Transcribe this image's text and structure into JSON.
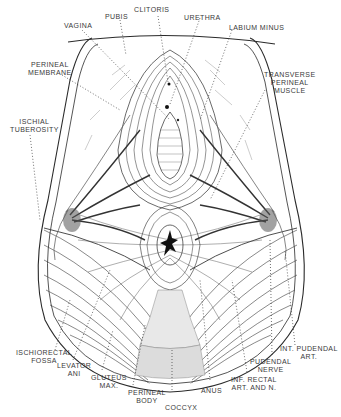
{
  "figure": {
    "colors": {
      "ink": "#2a2a2a",
      "label": "#3a3a3a",
      "background": "#ffffff",
      "shading": "#8a8a8a"
    },
    "labels": [
      {
        "id": "vagina",
        "line1": "VAGINA",
        "line2": ""
      },
      {
        "id": "pubis",
        "line1": "PUBIS",
        "line2": ""
      },
      {
        "id": "clitoris",
        "line1": "CLITORIS",
        "line2": ""
      },
      {
        "id": "urethra",
        "line1": "URETHRA",
        "line2": ""
      },
      {
        "id": "labium-minus",
        "line1": "LABIUM MINUS",
        "line2": ""
      },
      {
        "id": "perineal-membrane",
        "line1": "PERINEAL",
        "line2": "MEMBRANE"
      },
      {
        "id": "transverse-perineal-muscle",
        "line1": "TRANSVERSE",
        "line2": "PERINEAL",
        "line3": "MUSCLE"
      },
      {
        "id": "ischial-tuberosity",
        "line1": "ISCHIAL",
        "line2": "TUBEROSITY"
      },
      {
        "id": "ischiorectal-fossa",
        "line1": "ISCHIORECTAL",
        "line2": "FOSSA"
      },
      {
        "id": "levator-ani",
        "line1": "LEVATOR",
        "line2": "ANI"
      },
      {
        "id": "gluteus-max",
        "line1": "GLUTEUS",
        "line2": "MAX."
      },
      {
        "id": "perineal-body",
        "line1": "PERINEAL",
        "line2": "BODY"
      },
      {
        "id": "coccyx",
        "line1": "COCCYX",
        "line2": ""
      },
      {
        "id": "anus",
        "line1": "ANUS",
        "line2": ""
      },
      {
        "id": "inf-rectal",
        "line1": "INF. RECTAL",
        "line2": "ART. AND N."
      },
      {
        "id": "pudendal-nerve",
        "line1": "PUDENDAL",
        "line2": "NERVE"
      },
      {
        "id": "int-pudendal",
        "line1": "INT. PUDENDAL",
        "line2": "ART."
      }
    ]
  }
}
